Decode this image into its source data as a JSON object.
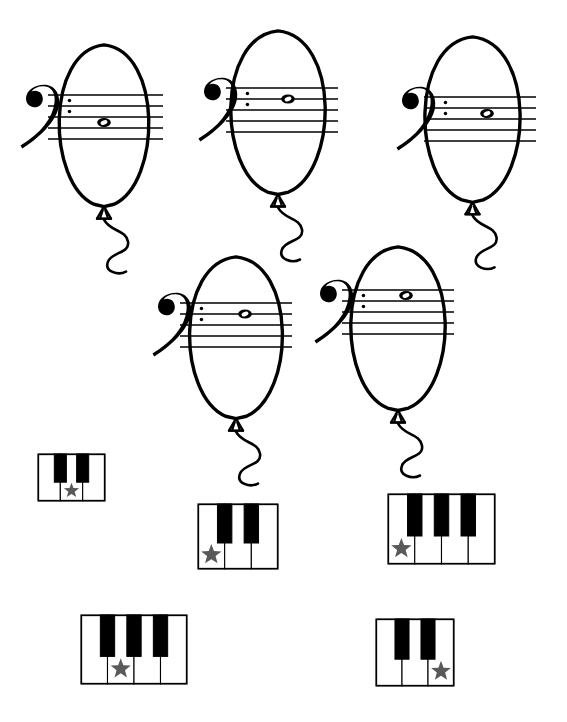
{
  "worksheet": {
    "title": "Bass Clef Note Balloons and Piano Key Match",
    "background_color": "#ffffff",
    "ink_color": "#000000",
    "star_color": "#595959",
    "width": 567,
    "height": 722
  },
  "balloons": [
    {
      "id": "balloon-1",
      "label": "Balloon 1",
      "clef": "bass-clef",
      "clef_glyph": "𝌢",
      "note_type": "whole-note",
      "note_glyph": "𝅝",
      "staff_lines": 5,
      "note_position": "space between line 3 and line 4 (from top)",
      "note_step_from_top_line": 2.5,
      "x": 45,
      "y": 44,
      "w": 118,
      "h": 176,
      "staff_x": 48,
      "staff_y": 95,
      "staff_w": 115,
      "note_cx": 104
    },
    {
      "id": "balloon-2",
      "label": "Balloon 2",
      "clef": "bass-clef",
      "clef_glyph": "𝌢",
      "note_type": "whole-note",
      "note_glyph": "𝅝",
      "staff_lines": 5,
      "note_position": "on line 2 (from top)",
      "note_step_from_top_line": 1.0,
      "x": 216,
      "y": 30,
      "w": 124,
      "h": 178,
      "staff_x": 226,
      "staff_y": 88,
      "staff_w": 112,
      "note_cx": 288
    },
    {
      "id": "balloon-3",
      "label": "Balloon 3",
      "clef": "bass-clef",
      "clef_glyph": "𝌢",
      "note_type": "whole-note",
      "note_glyph": "𝅝",
      "staff_lines": 5,
      "note_position": "space between line 2 and line 3 (from top)",
      "note_step_from_top_line": 1.5,
      "x": 410,
      "y": 36,
      "w": 125,
      "h": 180,
      "staff_x": 424,
      "staff_y": 97,
      "staff_w": 112,
      "note_cx": 487
    },
    {
      "id": "balloon-4",
      "label": "Balloon 4",
      "clef": "bass-clef",
      "clef_glyph": "𝌢",
      "note_type": "whole-note",
      "note_glyph": "𝅝",
      "staff_lines": 5,
      "note_position": "on line 2 (from top)",
      "note_step_from_top_line": 1.0,
      "x": 175,
      "y": 256,
      "w": 122,
      "h": 176,
      "staff_x": 180,
      "staff_y": 303,
      "staff_w": 112,
      "note_cx": 245
    },
    {
      "id": "balloon-5",
      "label": "Balloon 5",
      "clef": "bass-clef",
      "clef_glyph": "𝌢",
      "note_type": "whole-note",
      "note_glyph": "𝅝",
      "staff_lines": 5,
      "note_position": "space between line 1 and line 2 (from top)",
      "note_step_from_top_line": 0.5,
      "x": 336,
      "y": 246,
      "w": 124,
      "h": 178,
      "staff_x": 342,
      "staff_y": 290,
      "staff_w": 112,
      "note_cx": 406
    }
  ],
  "pianos": [
    {
      "id": "piano-1",
      "label": "Piano 1",
      "white_keys": 3,
      "black_keys": 2,
      "black_key_slots": [
        0,
        1
      ],
      "starred_white_key_index": 1,
      "star_glyph": "★",
      "x": 38,
      "y": 454,
      "w": 67,
      "h": 47
    },
    {
      "id": "piano-2",
      "label": "Piano 2",
      "white_keys": 3,
      "black_keys": 2,
      "black_key_slots": [
        0,
        1
      ],
      "starred_white_key_index": 0,
      "star_glyph": "★",
      "x": 198,
      "y": 504,
      "w": 80,
      "h": 65
    },
    {
      "id": "piano-3",
      "label": "Piano 3",
      "white_keys": 4,
      "black_keys": 3,
      "black_key_slots": [
        0,
        1,
        2
      ],
      "starred_white_key_index": 0,
      "star_glyph": "★",
      "x": 388,
      "y": 494,
      "w": 107,
      "h": 70
    },
    {
      "id": "piano-4",
      "label": "Piano 4",
      "white_keys": 4,
      "black_keys": 3,
      "black_key_slots": [
        0,
        1,
        2
      ],
      "starred_white_key_index": 1,
      "star_glyph": "★",
      "x": 81,
      "y": 615,
      "w": 106,
      "h": 69
    },
    {
      "id": "piano-5",
      "label": "Piano 5",
      "white_keys": 3,
      "black_keys": 2,
      "black_key_slots": [
        0,
        1
      ],
      "starred_white_key_index": 2,
      "star_glyph": "★",
      "x": 376,
      "y": 619,
      "w": 78,
      "h": 67
    }
  ]
}
